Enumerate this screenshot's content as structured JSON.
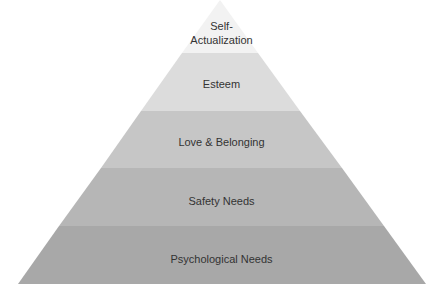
{
  "diagram": {
    "type": "pyramid",
    "levels": [
      {
        "label_line1": "Self-",
        "label_line2": "Actualization",
        "color": "#f2f2f2"
      },
      {
        "label": "Esteem",
        "color": "#dcdcdc"
      },
      {
        "label": "Love & Belonging",
        "color": "#c6c6c6"
      },
      {
        "label": "Safety Needs",
        "color": "#b6b6b6"
      },
      {
        "label": "Psychological Needs",
        "color": "#a8a8a8"
      }
    ]
  }
}
